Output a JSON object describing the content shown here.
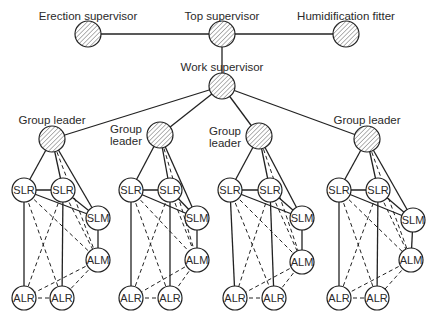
{
  "top_level": {
    "erection_supervisor": "Erection supervisor",
    "top_supervisor": "Top supervisor",
    "humidification_fitter": "Humidification fitter",
    "work_supervisor": "Work supervisor"
  },
  "groups": [
    {
      "leader_label": [
        "Group leader"
      ],
      "members": [
        "SLR",
        "SLR",
        "SLM",
        "ALM",
        "ALR",
        "ALR"
      ]
    },
    {
      "leader_label": [
        "Group",
        "leader"
      ],
      "members": [
        "SLR",
        "SLR",
        "SLM",
        "ALM",
        "ALR",
        "ALR"
      ]
    },
    {
      "leader_label": [
        "Group",
        "leader"
      ],
      "members": [
        "SLR",
        "SLR",
        "SLM",
        "ALM",
        "ALR",
        "ALR"
      ]
    },
    {
      "leader_label": [
        "Group leader"
      ],
      "members": [
        "SLR",
        "SLR",
        "SLM",
        "ALM",
        "ALR",
        "ALR"
      ]
    }
  ],
  "node_roles": {
    "hatched": "supervisor / group leader",
    "plain": "worker"
  },
  "group_edges": {
    "solid": [
      [
        "leader",
        "SLR1"
      ],
      [
        "leader",
        "SLR2"
      ],
      [
        "leader",
        "SLM"
      ],
      [
        "SLR1",
        "SLR2"
      ],
      [
        "SLR1",
        "SLM"
      ],
      [
        "SLR2",
        "SLM"
      ],
      [
        "SLM",
        "ALM"
      ],
      [
        "SLR1",
        "ALR1"
      ],
      [
        "SLR2",
        "ALR2"
      ]
    ],
    "dashed": [
      [
        "leader",
        "ALM"
      ],
      [
        "SLR1",
        "ALR2"
      ],
      [
        "SLR2",
        "ALR1"
      ],
      [
        "SLR1",
        "ALM"
      ],
      [
        "SLR2",
        "ALM"
      ],
      [
        "ALM",
        "ALR1"
      ],
      [
        "ALM",
        "ALR2"
      ],
      [
        "ALR1",
        "ALR2"
      ]
    ]
  },
  "top_edges": [
    [
      "erection_supervisor",
      "top_supervisor"
    ],
    [
      "top_supervisor",
      "humidification_fitter"
    ],
    [
      "top_supervisor",
      "work_supervisor"
    ],
    [
      "work_supervisor",
      "group1"
    ],
    [
      "work_supervisor",
      "group2"
    ],
    [
      "work_supervisor",
      "group3"
    ],
    [
      "work_supervisor",
      "group4"
    ]
  ]
}
